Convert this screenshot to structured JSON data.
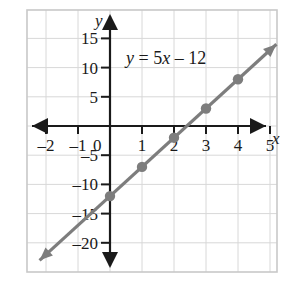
{
  "figure": {
    "frame": {
      "x": 27,
      "y": 10,
      "width": 250,
      "height": 262
    },
    "background_color": "#ffffff",
    "frame_color": "#c8c8c8",
    "grid_color": "#d8d8d8",
    "axis_color": "#1a1a1a",
    "line_color": "#7d7d7d",
    "point_color": "#7d7d7d",
    "text_color": "#1a1a1a"
  },
  "labels": {
    "x_axis_name": "x",
    "y_axis_name": "y",
    "equation_parts": {
      "y": "y",
      "equals": " = 5",
      "x": "x",
      "tail": " – 12"
    },
    "equation_text": "y = 5x – 12"
  },
  "chart_data": {
    "type": "line",
    "title": "",
    "equation": "y = 5x − 12",
    "slope": 5,
    "intercept": -12,
    "xlabel": "x",
    "ylabel": "y",
    "xlim": [
      -2.6,
      5.6
    ],
    "ylim": [
      -22.5,
      17.5
    ],
    "grid": true,
    "legend": "none",
    "x_ticks": [
      -2,
      -1,
      0,
      1,
      2,
      3,
      4,
      5
    ],
    "x_tick_labels": [
      "–2",
      "–1",
      "0",
      "1",
      "2",
      "3",
      "4",
      "5"
    ],
    "y_ticks": [
      15,
      10,
      5,
      -5,
      -10,
      -15,
      -20
    ],
    "y_tick_labels": [
      "15",
      "10",
      "5",
      "–5",
      "–10",
      "–15",
      "–20"
    ],
    "x_grid_step": 1,
    "y_grid_step": 5,
    "series": [
      {
        "name": "y = 5x − 12",
        "x": [
          -2.2,
          5.2
        ],
        "y": [
          -23,
          14
        ],
        "arrow_start": true,
        "arrow_end": true,
        "points": [
          {
            "x": 0,
            "y": -12
          },
          {
            "x": 1,
            "y": -7
          },
          {
            "x": 2,
            "y": -2
          },
          {
            "x": 3,
            "y": 3
          },
          {
            "x": 4,
            "y": 8
          }
        ]
      }
    ],
    "annotations": [
      {
        "text": "y = 5x – 12",
        "x": 0.6,
        "y": 11.5
      }
    ]
  }
}
